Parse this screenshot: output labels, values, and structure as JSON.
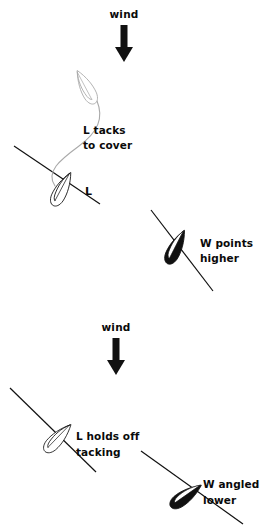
{
  "figure": {
    "background_color": "#ffffff",
    "ink_color": "#111111",
    "ghost_color": "#a9a9a9",
    "width": 261,
    "height": 526
  },
  "panels": [
    {
      "id": "upper",
      "wind": {
        "label": "wind",
        "arrow_direction": "down",
        "label_x": 124,
        "label_y": 18,
        "arrow_x": 124,
        "arrow_top": 25,
        "arrow_bottom": 62
      },
      "annotations": [
        {
          "id": "l-tacks",
          "lines": [
            "L tacks",
            "to cover"
          ],
          "x": 83,
          "y": 134
        },
        {
          "id": "w-points",
          "lines": [
            "W points",
            "higher"
          ],
          "x": 200,
          "y": 247
        }
      ],
      "boats": [
        {
          "id": "l-ghost",
          "style": "ghost-outline",
          "label": "",
          "x": 86,
          "y": 87,
          "rotation": -28,
          "scale": 1.0
        },
        {
          "id": "l-boat",
          "style": "outline",
          "label": "L",
          "label_x": 85,
          "label_y": 195,
          "x": 62,
          "y": 189,
          "rotation": 28,
          "scale": 1.0
        },
        {
          "id": "w-boat",
          "style": "filled",
          "label": "",
          "x": 176,
          "y": 247,
          "rotation": 27,
          "scale": 1.0
        }
      ],
      "course_lines": [
        {
          "id": "l-course",
          "x1": 14,
          "y1": 146,
          "x2": 100,
          "y2": 204
        },
        {
          "id": "w-course",
          "x1": 151,
          "y1": 210,
          "x2": 213,
          "y2": 291
        }
      ],
      "tack_path": {
        "id": "l-tack-curve",
        "description": "curved S-shaped tacking track from L boat to ghost boat",
        "d": "M 55 186 C 45 172, 60 160, 79 146 C 98 132, 104 118, 97 101"
      }
    },
    {
      "id": "lower",
      "wind": {
        "label": "wind",
        "arrow_direction": "down",
        "label_x": 116,
        "label_y": 331,
        "arrow_x": 116,
        "arrow_top": 338,
        "arrow_bottom": 375
      },
      "annotations": [
        {
          "id": "l-holds-off",
          "lines": [
            "L holds off",
            "tacking"
          ],
          "x": 76,
          "y": 440
        },
        {
          "id": "w-angled",
          "lines": [
            "W angled",
            "lower"
          ],
          "x": 203,
          "y": 488
        }
      ],
      "boats": [
        {
          "id": "l-boat-2",
          "style": "outline",
          "label": "",
          "x": 58,
          "y": 438,
          "rotation": 30,
          "scale": 1.0
        },
        {
          "id": "w-boat-2",
          "style": "filled",
          "label": "",
          "x": 186,
          "y": 496,
          "rotation": 35,
          "scale": 1.0
        }
      ],
      "course_lines": [
        {
          "id": "l-course-2",
          "x1": 10,
          "y1": 388,
          "x2": 96,
          "y2": 472
        },
        {
          "id": "w-course-2",
          "x1": 141,
          "y1": 451,
          "x2": 243,
          "y2": 524
        }
      ]
    }
  ],
  "caption": {
    "title": "",
    "subtitle": ""
  }
}
